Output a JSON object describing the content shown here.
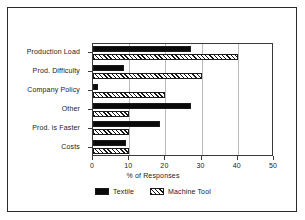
{
  "chart_data": {
    "type": "bar",
    "orientation": "horizontal",
    "title": "",
    "xlabel": "% of Responses",
    "ylabel": "",
    "xlim": [
      0,
      50
    ],
    "xticks": [
      0,
      10,
      20,
      30,
      40,
      50
    ],
    "grid": true,
    "grid_axis": "x",
    "legend_position": "bottom-center",
    "categories": [
      "Production Load",
      "Prod. Difficulty",
      "Company Policy",
      "Other",
      "Prod. is Faster",
      "Costs"
    ],
    "series": [
      {
        "name": "Textile",
        "fill": "solid-black",
        "color": "#0a0a0a",
        "values": [
          27,
          8.5,
          1.5,
          27,
          18.5,
          9
        ]
      },
      {
        "name": "Machine Tool",
        "fill": "diagonal-hatch",
        "color": "#141414",
        "values": [
          40,
          30,
          20,
          10,
          10,
          10
        ]
      }
    ]
  },
  "axis": {
    "x_title": "% of Responses",
    "tick_labels": [
      "0",
      "10",
      "20",
      "30",
      "40",
      "50"
    ]
  },
  "legend": {
    "entries": [
      {
        "label": "Textile"
      },
      {
        "label": "Machine Tool"
      }
    ]
  },
  "colors": {
    "frame": "#2b2b2b",
    "plot_border": "#3a3a3a",
    "gridline": "#b9b9b9",
    "textile": "#0a0a0a",
    "machine_tool": "#141414",
    "background": "#ffffff"
  }
}
